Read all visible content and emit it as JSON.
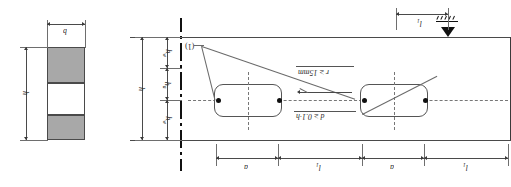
{
  "figure": {
    "ink_color": "#2b2b2b",
    "flange_fill": "#a8a8a8",
    "web_fill": "#ffffff",
    "background": "#ffffff"
  },
  "cross_section": {
    "name": "cross-section-view",
    "width_label": "b",
    "height_label": "h",
    "parts": [
      {
        "name": "top-flange",
        "fill": "#a8a8a8"
      },
      {
        "name": "web",
        "fill": "#ffffff"
      },
      {
        "name": "bottom-flange",
        "fill": "#a8a8a8"
      }
    ]
  },
  "elevation": {
    "name": "beam-elevation-view",
    "callout": "(1)",
    "vertical_dims": [
      {
        "label": "h",
        "sub": "w"
      },
      {
        "label": "h",
        "sub": "a"
      },
      {
        "label": "h",
        "sub": "w"
      }
    ],
    "overall_height_label": "h",
    "notes": [
      {
        "id": "radius-note",
        "text": "r ≥ 15mm"
      },
      {
        "id": "depth-note",
        "text": "d ≥ 0.1·h"
      }
    ],
    "horizontal_dims": [
      {
        "label": "a",
        "sub": ""
      },
      {
        "label": "l",
        "sub": "1"
      },
      {
        "label": "a",
        "sub": ""
      },
      {
        "label": "l",
        "sub": "1"
      }
    ],
    "top_dim": {
      "label": "l",
      "sub": "1"
    },
    "support": {
      "name": "pin-support",
      "type": "triangle-with-hatching"
    },
    "openings": [
      {
        "name": "web-opening-left",
        "shape": "rounded-rectangle"
      },
      {
        "name": "web-opening-right",
        "shape": "rounded-rectangle"
      }
    ]
  }
}
